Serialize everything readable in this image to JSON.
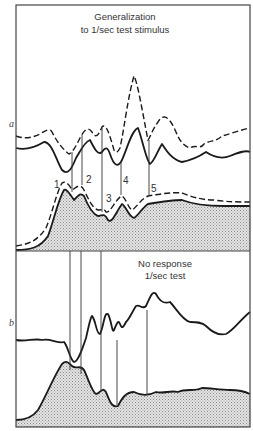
{
  "chart_data": {
    "type": "line",
    "frame": {
      "x": 16,
      "y": 5,
      "width": 234,
      "height": 422
    },
    "divider_y": 251,
    "shade_color": "#cfcfcf",
    "panels": [
      {
        "id": "a",
        "label": "a",
        "label_pos": [
          9,
          127
        ],
        "title_lines": [
          "Generalization",
          "to 1/sec test stimulus"
        ],
        "title_pos": [
          [
            125,
            20
          ],
          [
            125,
            33
          ]
        ],
        "marker_labels": [
          {
            "text": "1",
            "x": 54,
            "y": 188
          },
          {
            "text": "2",
            "x": 86,
            "y": 183
          },
          {
            "text": "3",
            "x": 106,
            "y": 202
          },
          {
            "text": "4",
            "x": 123,
            "y": 184
          },
          {
            "text": "5",
            "x": 151,
            "y": 192
          }
        ],
        "vertical_markers": [
          {
            "x": 72,
            "y1": 152,
            "y2": 192
          },
          {
            "x": 82,
            "y1": 135,
            "y2": 185
          },
          {
            "x": 102,
            "y1": 128,
            "y2": 212
          },
          {
            "x": 121,
            "y1": 162,
            "y2": 195
          },
          {
            "x": 149,
            "y1": 140,
            "y2": 196
          }
        ],
        "dashed_upper": "M16,136 C24,139 32,138 40,134 C46,130 50,128 52,132 C58,144 64,150 69,154 C73,152 76,146 80,138 C84,130 88,126 92,132 C96,140 99,134 102,127 C106,122 110,136 114,150 C116,154 118,152 120,148 C124,130 128,96 134,76 C138,84 142,110 148,140 C150,138 152,130 158,122 C164,112 170,118 176,132 C180,142 184,146 190,148 C196,144 200,150 204,144 C210,140 216,142 222,136 C230,134 240,130 250,128",
        "solid_upper": "M16,148 C24,150 34,148 44,142 C52,142 56,160 62,170 C68,176 72,168 76,158 C80,152 84,142 90,140 C94,148 98,156 102,152 C106,146 108,148 110,154 C114,166 118,168 122,160 C128,146 132,130 138,128 C142,138 146,160 150,164 C154,162 158,150 162,144 C166,150 172,160 182,162 C192,160 200,156 206,152 C212,156 220,160 230,156 C240,152 246,150 250,152",
        "dashed_lower": "M16,246 C30,244 38,240 46,228 C52,214 56,194 62,183 C66,180 70,186 72,190 C76,188 80,182 84,190 C88,198 92,208 98,210 C102,210 104,208 106,212 C110,214 116,198 122,196 C126,198 128,208 132,210 C136,208 140,200 148,196 C160,194 172,192 182,193 C190,196 200,200 214,200 C228,202 240,202 250,202",
        "solid_lower": "M16,250 C30,250 40,248 48,236 C54,220 58,200 64,190 C66,188 70,194 74,200 C78,196 80,192 84,196 C88,206 92,214 98,216 C102,216 104,212 108,220 C112,224 116,212 122,204 C126,206 128,216 134,218 C138,216 142,208 148,204 C160,202 172,200 182,200 C192,204 208,206 224,206 C236,206 244,206 250,206",
        "shade_area": "M16,251 L16,250 C30,250 40,248 48,236 C54,220 58,200 64,190 C66,188 70,194 74,200 C78,196 80,192 84,196 C88,206 92,214 98,216 C102,216 104,212 108,220 C112,224 116,212 122,204 C126,206 128,216 134,218 C138,216 142,208 148,204 C160,202 172,200 182,200 C192,204 208,206 224,206 C236,206 244,206 250,206 L250,251 Z"
      },
      {
        "id": "b",
        "label": "b",
        "label_pos": [
          9,
          326
        ],
        "title_lines": [
          "No response",
          "1/sec test"
        ],
        "title_pos": [
          [
            165,
            267
          ],
          [
            165,
            279
          ]
        ],
        "vertical_markers": [
          {
            "x": 70,
            "y1": 251,
            "y2": 370
          },
          {
            "x": 81,
            "y1": 251,
            "y2": 374
          },
          {
            "x": 101,
            "y1": 251,
            "y2": 392
          },
          {
            "x": 117,
            "y1": 340,
            "y2": 405
          },
          {
            "x": 147,
            "y1": 310,
            "y2": 395
          }
        ],
        "solid_upper": "M16,340 C26,342 34,338 42,340 C50,338 58,344 64,342 C68,346 70,360 74,362 C78,362 82,350 86,338 C88,330 90,318 92,316 C96,320 96,334 100,334 C104,326 104,312 108,314 C112,322 112,334 114,330 C116,326 118,318 120,324 C122,330 124,326 126,322 C130,318 132,312 136,306 C140,304 142,310 146,306 C150,298 152,290 156,294 C160,302 164,304 170,302 C176,308 182,320 190,322 C196,322 202,322 206,326 C212,332 218,336 226,334 C234,330 240,320 250,312",
        "solid_lower": "M16,420 C24,420 32,418 38,410 C46,396 54,376 62,364 C66,360 68,362 72,366 C76,370 80,364 84,370 C88,378 92,392 96,394 C100,394 102,386 106,392 C110,402 112,408 118,406 C122,398 126,392 134,392 C142,396 148,396 156,392 C164,394 170,390 178,392 C186,388 194,392 202,388 C210,388 220,390 230,390 C240,390 246,392 250,394",
        "shade_area": "M16,427 L16,420 C24,420 32,418 38,410 C46,396 54,376 62,364 C66,360 68,362 72,366 C76,370 80,364 84,370 C88,378 92,392 96,394 C100,394 102,386 106,392 C110,402 112,408 118,406 C122,398 126,392 134,392 C142,396 148,396 156,392 C164,394 170,390 178,392 C186,388 194,392 202,388 C210,388 220,390 230,390 C240,390 246,392 250,394 L250,427 Z"
      }
    ]
  }
}
